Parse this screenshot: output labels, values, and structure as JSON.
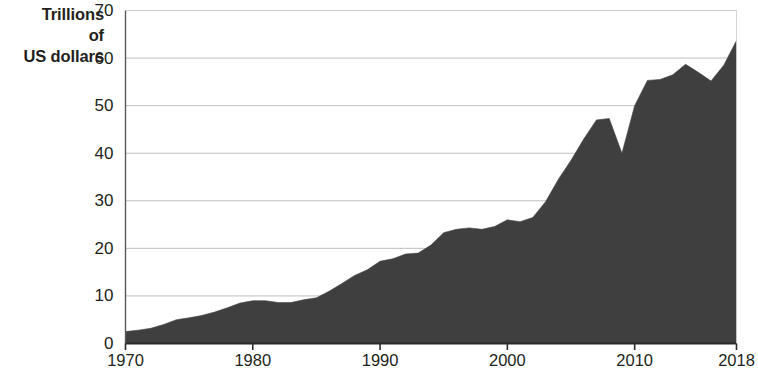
{
  "chart_data": {
    "type": "area",
    "title": "",
    "subtitle": "",
    "xlabel": "",
    "ylabel": "Trillions of US dollars",
    "ylabel_lines": [
      "Trillions",
      "of",
      "US dollars"
    ],
    "xlim": [
      1970,
      2018
    ],
    "ylim": [
      0,
      70
    ],
    "ytick_values": [
      0,
      10,
      20,
      30,
      40,
      50,
      60,
      70
    ],
    "ytick_labels": [
      "0",
      "10",
      "20",
      "30",
      "40",
      "50",
      "60",
      "70"
    ],
    "xtick_values": [
      1970,
      1980,
      1990,
      2000,
      2010,
      2018
    ],
    "xtick_labels": [
      "1970",
      "1980",
      "1990",
      "2000",
      "2010",
      "2018"
    ],
    "grid": "horizontal",
    "legend": "none",
    "series": [
      {
        "name": "World merchandise and services exports",
        "fill_color": "#3f3f3f",
        "x": [
          1970,
          1971,
          1972,
          1973,
          1974,
          1975,
          1976,
          1977,
          1978,
          1979,
          1980,
          1981,
          1982,
          1983,
          1984,
          1985,
          1986,
          1987,
          1988,
          1989,
          1990,
          1991,
          1992,
          1993,
          1994,
          1995,
          1996,
          1997,
          1998,
          1999,
          2000,
          2001,
          2002,
          2003,
          2004,
          2005,
          2006,
          2007,
          2008,
          2009,
          2010,
          2011,
          2012,
          2013,
          2014,
          2015,
          2016,
          2017,
          2018
        ],
        "values": [
          2.5,
          2.8,
          3.2,
          4.0,
          5.0,
          5.4,
          5.9,
          6.6,
          7.5,
          8.5,
          9.0,
          9.0,
          8.6,
          8.6,
          9.2,
          9.6,
          11.0,
          12.6,
          14.3,
          15.5,
          17.3,
          17.8,
          18.8,
          19.0,
          20.7,
          23.3,
          24.0,
          24.3,
          24.0,
          24.6,
          26.0,
          25.6,
          26.5,
          29.8,
          34.5,
          38.5,
          43.0,
          47.0,
          47.3,
          40.0,
          50.0,
          55.3,
          55.5,
          56.5,
          58.7,
          57.0,
          55.2,
          58.5,
          63.7
        ]
      }
    ]
  },
  "axis_title": {
    "line1": "Trillions",
    "line2": "of",
    "line3": "US dollars"
  }
}
